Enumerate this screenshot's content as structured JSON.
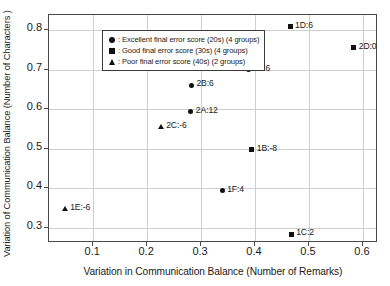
{
  "chart_data": {
    "type": "scatter",
    "title": "",
    "xlabel": "Variation in Communication Balance (Number of Remarks)",
    "ylabel": "Variation of Communication Balance (Number of Characters )",
    "xlim": [
      0.018,
      0.628
    ],
    "ylim": [
      0.262,
      0.838
    ],
    "xticks": [
      0.1,
      0.2,
      0.3,
      0.4,
      0.5,
      0.6
    ],
    "xticklabels": [
      "0.1",
      "0.2",
      "0.3",
      "0.4",
      "0.5",
      "0.6"
    ],
    "yticks": [
      0.3,
      0.4,
      0.5,
      0.6,
      0.7,
      0.8
    ],
    "yticklabels": [
      "0.3",
      "0.4",
      "0.5",
      "0.6",
      "0.7",
      "0.8"
    ],
    "grid": true,
    "legend_position": "upper-left",
    "legend": [
      {
        "marker": "circle",
        "label": ": Excellent final error score (20s) (4 groups)"
      },
      {
        "marker": "square",
        "label": ": Good final error score (30s) (4 groups)"
      },
      {
        "marker": "triangle",
        "label": ": Poor final error score (40s) (2 groups)"
      }
    ],
    "points": [
      {
        "label": "1D:6",
        "x": 0.465,
        "y": 0.808,
        "marker": "square"
      },
      {
        "label": "2D:0",
        "x": 0.583,
        "y": 0.755,
        "marker": "square"
      },
      {
        "label": "1A:6",
        "x": 0.387,
        "y": 0.7,
        "marker": "circle"
      },
      {
        "label": "2B:6",
        "x": 0.282,
        "y": 0.661,
        "marker": "circle"
      },
      {
        "label": "2A:12",
        "x": 0.281,
        "y": 0.594,
        "marker": "circle"
      },
      {
        "label": "2C:-6",
        "x": 0.226,
        "y": 0.554,
        "marker": "triangle"
      },
      {
        "label": "1B:-8",
        "x": 0.394,
        "y": 0.497,
        "marker": "square"
      },
      {
        "label": "1F:4",
        "x": 0.339,
        "y": 0.394,
        "marker": "circle"
      },
      {
        "label": "1E:-6",
        "x": 0.048,
        "y": 0.348,
        "marker": "triangle"
      },
      {
        "label": "1C:2",
        "x": 0.467,
        "y": 0.284,
        "marker": "square"
      }
    ]
  }
}
